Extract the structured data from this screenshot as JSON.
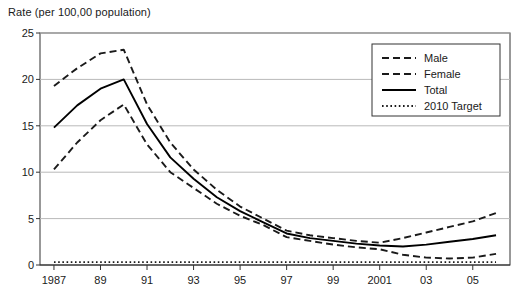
{
  "chart_data": {
    "type": "line",
    "title": "",
    "ylabel": "Rate (per 100,00 population)",
    "xlabel": "",
    "ylim": [
      0,
      25
    ],
    "yticks": [
      0,
      5,
      10,
      15,
      20,
      25
    ],
    "grid": true,
    "legend_position": "top-right",
    "x": [
      1987,
      1988,
      1989,
      1990,
      1991,
      1992,
      1993,
      1994,
      1995,
      1996,
      1997,
      1998,
      1999,
      2000,
      2001,
      2002,
      2003,
      2004,
      2005,
      2006
    ],
    "xtick_labels": [
      "1987",
      "89",
      "91",
      "93",
      "95",
      "97",
      "99",
      "2001",
      "03",
      "05"
    ],
    "xtick_values": [
      1987,
      1989,
      1991,
      1993,
      1995,
      1997,
      1999,
      2001,
      2003,
      2005
    ],
    "series": [
      {
        "name": "Male",
        "style": "dashed",
        "color": "#1a1a1a",
        "values": [
          19.3,
          21.2,
          22.8,
          23.2,
          17.3,
          13.2,
          10.3,
          8.1,
          6.3,
          5.0,
          3.7,
          3.2,
          2.9,
          2.6,
          2.4,
          2.9,
          3.5,
          4.1,
          4.7,
          5.6
        ]
      },
      {
        "name": "Female",
        "style": "dashed",
        "color": "#1a1a1a",
        "values": [
          10.3,
          13.2,
          15.6,
          17.3,
          13.0,
          10.0,
          8.3,
          6.6,
          5.3,
          4.3,
          3.0,
          2.6,
          2.2,
          1.9,
          1.7,
          1.1,
          0.8,
          0.7,
          0.8,
          1.2
        ]
      },
      {
        "name": "Total",
        "style": "solid",
        "color": "#000000",
        "values": [
          14.8,
          17.2,
          19.0,
          20.0,
          15.2,
          11.6,
          9.3,
          7.3,
          5.8,
          4.6,
          3.4,
          2.9,
          2.6,
          2.3,
          2.1,
          2.0,
          2.2,
          2.5,
          2.8,
          3.2
        ]
      },
      {
        "name": "2010 Target",
        "style": "dotted",
        "color": "#1a1a1a",
        "values": [
          0.3,
          0.3,
          0.3,
          0.3,
          0.3,
          0.3,
          0.3,
          0.3,
          0.3,
          0.3,
          0.3,
          0.3,
          0.3,
          0.3,
          0.3,
          0.3,
          0.3,
          0.3,
          0.3,
          0.3
        ]
      }
    ]
  },
  "legend": {
    "items": [
      {
        "label": "Male"
      },
      {
        "label": "Female"
      },
      {
        "label": "Total"
      },
      {
        "label": "2010 Target"
      }
    ]
  }
}
